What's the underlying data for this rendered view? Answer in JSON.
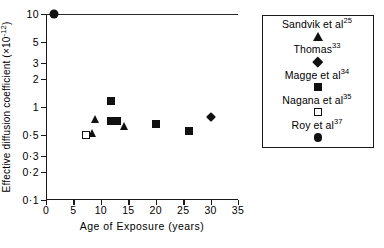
{
  "chart_data": {
    "type": "scatter",
    "title": "",
    "xlabel": "Age of Exposure (years)",
    "ylabel_text": "Effective diffusion coefficient",
    "ylabel_units": "(×10",
    "ylabel_exponent": "-12",
    "ylabel_units_close": ")",
    "xlim": [
      0,
      35
    ],
    "ylim": [
      0.1,
      10
    ],
    "yscale": "log",
    "xscale": "linear",
    "grid": false,
    "legend_position": "right-outside",
    "xticks": [
      0,
      5,
      10,
      15,
      20,
      25,
      30,
      35
    ],
    "xtick_labels": [
      "0",
      "5",
      "10",
      "15",
      "20",
      "25",
      "30",
      "35"
    ],
    "yticks": [
      10,
      5,
      3,
      2,
      1,
      0.5,
      0.3,
      0.2,
      0.1
    ],
    "ytick_labels": [
      "10",
      "5",
      "3",
      "2",
      "1",
      "0·5",
      "0·3",
      "0·2",
      "0·1"
    ],
    "series": [
      {
        "name": "Sandvik et al",
        "reference": "25",
        "marker": "triangle",
        "points": [
          {
            "x": 9.0,
            "y": 0.74
          },
          {
            "x": 8.3,
            "y": 0.53
          },
          {
            "x": 14.2,
            "y": 0.63
          }
        ]
      },
      {
        "name": "Thomas",
        "reference": "33",
        "marker": "diamond",
        "points": [
          {
            "x": 30.0,
            "y": 0.78
          }
        ]
      },
      {
        "name": "Magge et al",
        "reference": "34",
        "marker": "square",
        "points": [
          {
            "x": 11.8,
            "y": 1.15
          },
          {
            "x": 11.8,
            "y": 0.7
          },
          {
            "x": 13.0,
            "y": 0.7
          },
          {
            "x": 20.0,
            "y": 0.66
          },
          {
            "x": 26.0,
            "y": 0.55
          }
        ]
      },
      {
        "name": "Nagana et al",
        "reference": "35",
        "marker": "open-square",
        "points": [
          {
            "x": 7.3,
            "y": 0.5
          }
        ]
      },
      {
        "name": "Roy et al",
        "reference": "37",
        "marker": "circle",
        "points": [
          {
            "x": 1.5,
            "y": 10.0
          }
        ]
      }
    ]
  },
  "legend": {
    "entries": [
      {
        "label": "Sandvik et al",
        "sup": "25",
        "marker": "triangle"
      },
      {
        "label": "Thomas",
        "sup": "33",
        "marker": "diamond"
      },
      {
        "label": "Magge et al",
        "sup": "34",
        "marker": "square"
      },
      {
        "label": "Nagana et al",
        "sup": "35",
        "marker": "open-square"
      },
      {
        "label": "Roy et al",
        "sup": "37",
        "marker": "circle"
      }
    ]
  }
}
